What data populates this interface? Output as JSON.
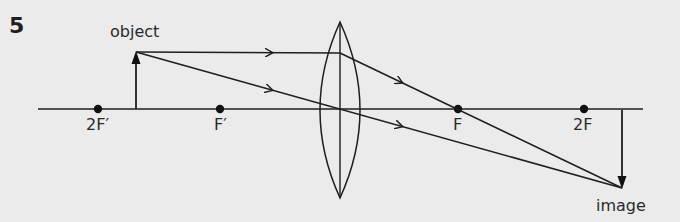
{
  "question_number": "5",
  "labels": {
    "object": "object",
    "image": "image"
  },
  "points": [
    {
      "label": "2F′",
      "x": 98
    },
    {
      "label": "F′",
      "x": 220
    },
    {
      "label": "F",
      "x": 458
    },
    {
      "label": "2F",
      "x": 584
    }
  ],
  "colors": {
    "background": "#ebebeb",
    "ink": "#1e1e1e"
  },
  "geometry": {
    "axis": {
      "x1": 38,
      "x2": 643,
      "y": 109
    },
    "lens": {
      "cx": 340,
      "top": 22,
      "bottom": 198,
      "half_width": 20
    },
    "object": {
      "x": 136,
      "base_y": 109,
      "tip_y": 52
    },
    "image": {
      "x": 622,
      "base_y": 110,
      "tip_y": 188
    }
  }
}
